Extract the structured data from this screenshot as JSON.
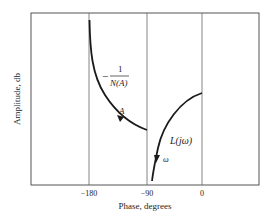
{
  "diagram": {
    "title": "",
    "xlabel": "Phase, degrees",
    "ylabel": "Amplitude, db",
    "x_ticks": [
      {
        "label": "−180",
        "value": -180
      },
      {
        "label": "−90",
        "value": -90
      },
      {
        "label": "0",
        "value": 0
      }
    ],
    "curves": [
      {
        "name": "describing-function",
        "label_numerator": "1",
        "label_prefix": "−",
        "label_denominator": "N(A)",
        "param_label": "A",
        "direction": "increasing A toward upper-left"
      },
      {
        "name": "loop-transfer",
        "label": "L(jω)",
        "param_label": "ω",
        "direction": "increasing ω downward"
      }
    ],
    "colors": {
      "frame": "#555555",
      "curve": "#1a1a1a",
      "text": "#222222"
    }
  }
}
